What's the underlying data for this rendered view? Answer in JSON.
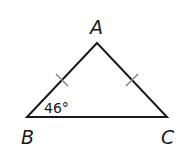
{
  "diagram": {
    "type": "isosceles-triangle",
    "vertices": {
      "A": {
        "label": "A",
        "x": 97,
        "y": 43
      },
      "B": {
        "label": "B",
        "x": 27,
        "y": 117
      },
      "C": {
        "label": "C",
        "x": 167,
        "y": 117
      }
    },
    "angle_label": "46°",
    "angle_at": "B",
    "congruent_sides": [
      "AB",
      "AC"
    ],
    "colors": {
      "line": "#1a1a1a",
      "tick": "#8a8a8a",
      "background": "#ffffff"
    }
  }
}
